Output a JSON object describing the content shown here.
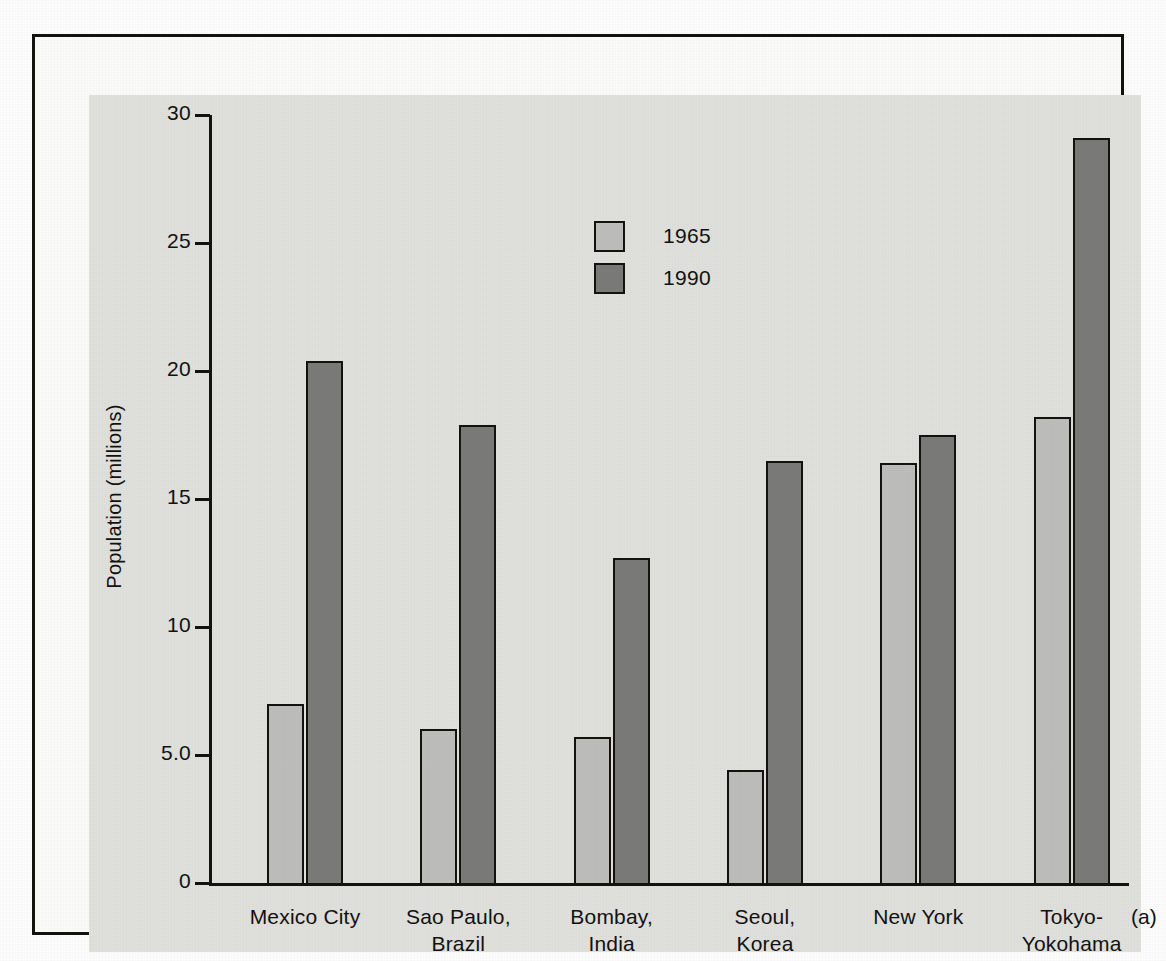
{
  "figure": {
    "panel_letter": "(a)"
  },
  "chart_data": {
    "type": "bar",
    "title": "",
    "subtitle": "",
    "xlabel": "",
    "ylabel": "Population (millions)",
    "ylim": [
      0,
      30
    ],
    "yticks": [
      0,
      5,
      10,
      15,
      20,
      25,
      30
    ],
    "ytick_labels": [
      "0",
      "5.0",
      "10",
      "15",
      "20",
      "25",
      "30"
    ],
    "grid": false,
    "legend_position": "upper-center",
    "categories": [
      "Mexico City",
      "Sao Paulo,\nBrazil",
      "Bombay,\nIndia",
      "Seoul,\nKorea",
      "New York",
      "Tokyo-\nYokohama"
    ],
    "series": [
      {
        "name": "1965",
        "color": "#bdbdbb",
        "values": [
          7.0,
          6.0,
          5.7,
          4.4,
          16.4,
          18.2
        ]
      },
      {
        "name": "1990",
        "color": "#7a7a78",
        "values": [
          20.4,
          17.9,
          12.7,
          16.5,
          17.5,
          29.1
        ]
      }
    ]
  },
  "colors": {
    "panel_background": "#e0e0dd",
    "frame": "#14120f",
    "series_1965": "#bdbdbb",
    "series_1990": "#7a7a78",
    "text": "#13110f"
  }
}
